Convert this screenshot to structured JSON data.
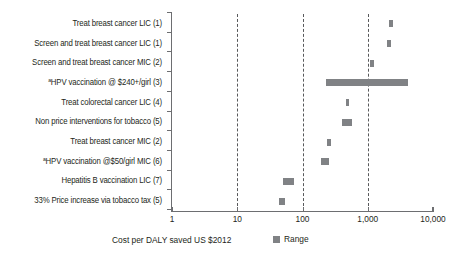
{
  "chart_data": {
    "type": "bar",
    "orientation": "horizontal",
    "title": "",
    "subtitle": "",
    "xlabel": "Cost per DALY saved US $2012",
    "ylabel": "",
    "xscale": "log",
    "xlim": [
      1,
      10000
    ],
    "xticks": [
      1,
      10,
      100,
      1000,
      10000
    ],
    "xtick_labels": [
      "1",
      "10",
      "100",
      "1,000",
      "10,000"
    ],
    "grid": "vertical dashed at 10, 100, 1,000",
    "gridlines": [
      10,
      100,
      1000
    ],
    "legend": {
      "position": "bottom-center",
      "entries": [
        {
          "label": "Range",
          "color": "#808285"
        }
      ]
    },
    "bar_color": "#808285",
    "footnote_marker": "a",
    "categories": [
      "Treat breast cancer LIC (1)",
      "Screen and treat breast cancer LIC (1)",
      "Screen and treat breast cancer MIC (2)",
      "HPV vaccination @ $240+/girl (3)",
      "Treat colorectal cancer LIC (4)",
      "Non price interventions for tobacco (5)",
      "Treat breast cancer MIC (2)",
      "HPV vaccination @$50/girl MIC (6)",
      "Hepatitis B vaccination LIC (7)",
      "33% Price increase via tobacco tax (5)"
    ],
    "ranges": [
      {
        "label": "Treat breast cancer LIC (1)",
        "superscript": "",
        "low": 2100,
        "high": 2400
      },
      {
        "label": "Screen and treat breast cancer LIC (1)",
        "superscript": "",
        "low": 1950,
        "high": 2250
      },
      {
        "label": "Screen and treat breast cancer MIC (2)",
        "superscript": "",
        "low": 1100,
        "high": 1250
      },
      {
        "label": "HPV vaccination @ $240+/girl (3)",
        "superscript": "a",
        "low": 230,
        "high": 4100
      },
      {
        "label": "Treat colorectal cancer LIC (4)",
        "superscript": "",
        "low": 460,
        "high": 520
      },
      {
        "label": "Non price interventions for tobacco (5)",
        "superscript": "",
        "low": 400,
        "high": 580
      },
      {
        "label": "Treat breast cancer MIC (2)",
        "superscript": "",
        "low": 240,
        "high": 275
      },
      {
        "label": "HPV vaccination @$50/girl MIC (6)",
        "superscript": "a",
        "low": 190,
        "high": 255
      },
      {
        "label": "Hepatitis B vaccination LIC (7)",
        "superscript": "",
        "low": 50,
        "high": 74
      },
      {
        "label": "33% Price increase via tobacco tax (5)",
        "superscript": "",
        "low": 44,
        "high": 54
      }
    ]
  },
  "axis": {
    "title": "Cost per DALY saved US $2012",
    "tick_labels": [
      "1",
      "10",
      "100",
      "1,000",
      "10,000"
    ]
  },
  "legend": {
    "range_label": "Range"
  }
}
